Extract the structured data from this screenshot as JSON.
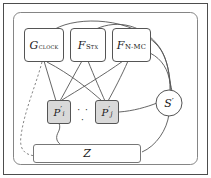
{
  "figure": {
    "kind": "protocol-simulation-diagram",
    "width": 211,
    "height": 178,
    "colors": {
      "stroke": "#555555",
      "border": "#4d4d4d",
      "text": "#1a1a1a",
      "party_fill": "#d9d9d9",
      "box_fill": "#ffffff",
      "background": "#ffffff"
    }
  },
  "nodes": {
    "clock": {
      "name": "G_CLOCK",
      "symbol": "G",
      "subscript": "clock",
      "shape": "rounded-rect"
    },
    "stx": {
      "name": "F_STX",
      "symbol": "F",
      "subscript": "Stx",
      "shape": "rounded-rect"
    },
    "nmc": {
      "name": "F_N-MC",
      "symbol": "F",
      "subscript": "N-MC",
      "shape": "rounded-rect"
    },
    "party_i": {
      "name": "P_i_prime",
      "symbol": "P",
      "prime": "′",
      "subscript": "i",
      "shape": "rounded-rect-shaded"
    },
    "party_j": {
      "name": "P_j_prime",
      "symbol": "P",
      "prime": "′",
      "subscript": "j",
      "shape": "rounded-rect-shaded"
    },
    "ellipsis": {
      "name": "parties-ellipsis",
      "text": "· · ·"
    },
    "simulator": {
      "name": "S_prime",
      "symbol": "S",
      "prime": "′",
      "shape": "circle"
    },
    "environment": {
      "name": "Z",
      "symbol": "Z",
      "shape": "rounded-rect-wide"
    }
  },
  "edges": [
    {
      "from": "clock",
      "to": "party_i",
      "style": "solid"
    },
    {
      "from": "clock",
      "to": "party_j",
      "style": "solid"
    },
    {
      "from": "stx",
      "to": "party_i",
      "style": "solid"
    },
    {
      "from": "stx",
      "to": "party_j",
      "style": "solid"
    },
    {
      "from": "nmc",
      "to": "party_i",
      "style": "solid"
    },
    {
      "from": "nmc",
      "to": "party_j",
      "style": "solid"
    },
    {
      "from": "clock",
      "to": "simulator",
      "style": "solid-arc"
    },
    {
      "from": "stx",
      "to": "simulator",
      "style": "solid-arc"
    },
    {
      "from": "nmc",
      "to": "simulator",
      "style": "solid-arc"
    },
    {
      "from": "party_j",
      "to": "simulator",
      "style": "solid"
    },
    {
      "from": "simulator",
      "to": "environment",
      "style": "solid"
    },
    {
      "from": "party_i",
      "to": "environment",
      "style": "solid-wavy"
    },
    {
      "from": "clock",
      "to": "environment",
      "style": "dashed"
    }
  ]
}
